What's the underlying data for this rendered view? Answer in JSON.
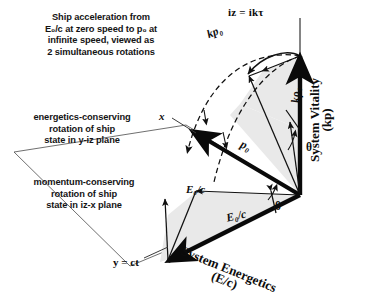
{
  "figure": {
    "type": "vector-geometry-diagram",
    "background_color": "#ffffff",
    "ink_color": "#111111",
    "wedge_fill_color": "#e9e9e9"
  },
  "captions": {
    "intro": [
      "Ship acceleration from",
      "E₀/c  at zero speed to p₀ at",
      "infinite speed, viewed as",
      "2 simultaneous rotations"
    ],
    "energetics_note": [
      "energetics-conserving",
      "rotation of ship",
      "state in y-iz plane"
    ],
    "momentum_note": [
      "momentum-conserving",
      "rotation of ship",
      "state in iz-x plane"
    ]
  },
  "axes": {
    "vertical_tip_label": "iz = ikτ",
    "x_axis_label": "x",
    "y_axis_label": "y = ct",
    "vitality_title": "System Vitality",
    "vitality_units": "(kp)",
    "energetics_title": "System Energetics",
    "energetics_units": "(E/c)"
  },
  "vectors": {
    "kp0_outer": "kp₀",
    "krho0_inner": "kρ₀",
    "p0": "p₀",
    "e0c_upper": "E₀/c",
    "e0c_lower": "E₀/c",
    "theta_top": "θ",
    "theta_bottom": "θ"
  }
}
